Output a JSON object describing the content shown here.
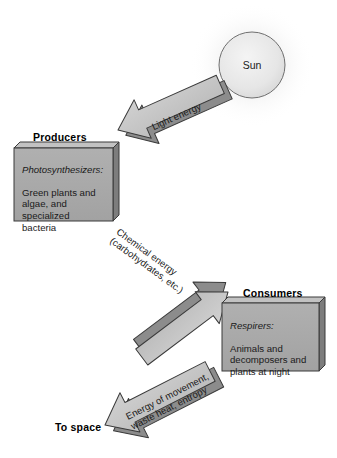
{
  "diagram": {
    "type": "energy-flow-diagram",
    "background_color": "#ffffff"
  },
  "palette": {
    "box_face": "#a9a9a9",
    "box_side": "#7d7d7d",
    "box_top": "#c2c2c2",
    "arrow_face": "#c9c9c9",
    "arrow_side": "#8c8c8c",
    "outline": "#3a3a3a",
    "sun_fill": "#ebebeb",
    "sun_outline": "#6f6f6f",
    "text": "#1a1a1a"
  },
  "sun": {
    "label": "Sun",
    "cx": 252,
    "cy": 65,
    "r": 33
  },
  "nodes": [
    {
      "id": "producers",
      "heading": "Producers",
      "italic_line": "Photosynthesizers:",
      "body": "Green plants and\nalgae, and\nspecialized\nbacteria"
    },
    {
      "id": "consumers",
      "heading": "Consumers",
      "italic_line": "Respirers:",
      "body": "Animals and\ndecomposers and\nplants at night"
    }
  ],
  "flows": [
    {
      "id": "light-energy",
      "label": "Light energy",
      "from": "sun",
      "to": "producers",
      "direction": "down-left"
    },
    {
      "id": "chemical-energy",
      "label": "Chemical energy\n(carbohydrates, etc.)",
      "from": "producers",
      "to": "consumers",
      "direction": "down-right"
    },
    {
      "id": "waste-energy",
      "label": "Energy of movement,\nwaste heat, entropy",
      "from": "consumers",
      "to": "to-space",
      "direction": "down-left"
    }
  ],
  "sink": {
    "id": "to-space",
    "label": "To space"
  }
}
